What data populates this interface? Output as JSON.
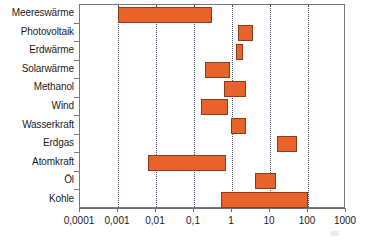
{
  "chart_data": {
    "type": "bar",
    "orientation": "horizontal",
    "scale": "log",
    "title": "",
    "xlabel": "",
    "ylabel": "",
    "xlim": [
      0.0001,
      1000
    ],
    "grid": true,
    "legend": null,
    "decimal_separator": ",",
    "xticks": [
      "0,0001",
      "0,001",
      "0,01",
      "0,1",
      "1",
      "10",
      "100",
      "1000"
    ],
    "xtick_values": [
      0.0001,
      0.001,
      0.01,
      0.1,
      1,
      10,
      100,
      1000
    ],
    "categories": [
      "Meereswärme",
      "Photovoltaik",
      "Erdwärme",
      "Solarwärme",
      "Methanol",
      "Wind",
      "Wasserkraft",
      "Erdgas",
      "Atomkraft",
      "Öl",
      "Kohle"
    ],
    "ranges": [
      {
        "category": "Meereswärme",
        "low": 0.001,
        "high": 0.3
      },
      {
        "category": "Photovoltaik",
        "low": 1.4,
        "high": 3.5
      },
      {
        "category": "Erdwärme",
        "low": 1.3,
        "high": 2.0
      },
      {
        "category": "Solarwärme",
        "low": 0.2,
        "high": 0.9
      },
      {
        "category": "Methanol",
        "low": 0.6,
        "high": 2.4
      },
      {
        "category": "Wind",
        "low": 0.15,
        "high": 0.8
      },
      {
        "category": "Wasserkraft",
        "low": 0.95,
        "high": 2.3
      },
      {
        "category": "Erdgas",
        "low": 15,
        "high": 50
      },
      {
        "category": "Atomkraft",
        "low": 0.006,
        "high": 0.7
      },
      {
        "category": "Öl",
        "low": 4,
        "high": 14
      },
      {
        "category": "Kohle",
        "low": 0.5,
        "high": 100
      }
    ],
    "colors": {
      "bar_fill": "#e8622c",
      "bar_border": "#8c3b1c",
      "gridline": "#4a4a6a",
      "axis": "#6e6e6e",
      "text": "#1b1b1b",
      "background": "#ffffff"
    }
  }
}
